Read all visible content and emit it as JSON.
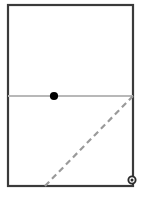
{
  "figure": {
    "canvas": {
      "width": 142,
      "height": 197,
      "background": "#ffffff"
    },
    "elements": {
      "rectangle": {
        "name": "outer rectangle",
        "x": 8,
        "y": 5,
        "width": 125,
        "height": 181,
        "stroke": "#3a3a3a",
        "stroke_width": 2.2,
        "fill": "#ffffff"
      },
      "horizontal_line": {
        "name": "horizontal bisector line",
        "x1": 8,
        "y1": 96,
        "x2": 133,
        "y2": 96,
        "stroke": "#b8b8b8",
        "stroke_width": 1.8
      },
      "point_marker": {
        "name": "solid point on horizontal line",
        "cx": 54,
        "cy": 96,
        "r": 4.1,
        "fill": "#000000"
      },
      "dashed_diagonal": {
        "name": "dashed diagonal line",
        "x1": 45,
        "y1": 186,
        "x2": 133,
        "y2": 96,
        "stroke": "#9a9a9a",
        "stroke_width": 2.2,
        "dash_pattern": "6 4"
      },
      "ring_marker": {
        "name": "hollow ring marker on right border",
        "cx": 132,
        "cy": 180,
        "r_outer": 3.6,
        "r_inner": 1.5,
        "stroke": "#2b2b2b",
        "stroke_width": 1.9,
        "fill": "#ffffff"
      }
    }
  }
}
